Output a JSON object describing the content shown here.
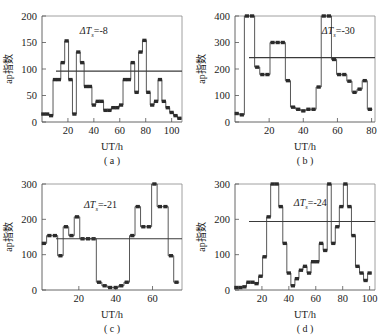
{
  "figure": {
    "panel_count": 4,
    "background": "#ffffff",
    "line_color": "#3a3a3a",
    "marker_color": "#2b2b2b"
  },
  "chart_data": [
    {
      "id": "panel-a",
      "type": "line",
      "caption": "( a )",
      "title": "",
      "xlabel": "UT/h",
      "ylabel": "ap指数",
      "annotation": "ΔT",
      "annotation_sub": "s",
      "annotation_value": "=-8",
      "annotation_full": "ΔTs=-8",
      "xlim": [
        0,
        108
      ],
      "ylim": [
        0,
        200
      ],
      "xticks": [
        20,
        40,
        60,
        80,
        100
      ],
      "yticks": [
        0,
        50,
        100,
        150,
        200
      ],
      "grid": false,
      "mean_value": 96,
      "step": true,
      "x": [
        1,
        4,
        7,
        10,
        13,
        16,
        19,
        22,
        25,
        28,
        31,
        34,
        37,
        40,
        43,
        46,
        49,
        52,
        55,
        58,
        61,
        64,
        67,
        70,
        73,
        76,
        79,
        82,
        85,
        88,
        91,
        94,
        97,
        100,
        103,
        106
      ],
      "y": [
        15,
        15,
        12,
        80,
        80,
        112,
        153,
        80,
        15,
        132,
        112,
        67,
        67,
        32,
        39,
        39,
        22,
        22,
        27,
        27,
        32,
        80,
        80,
        112,
        56,
        132,
        154,
        56,
        32,
        39,
        80,
        39,
        27,
        18,
        12,
        7
      ]
    },
    {
      "id": "panel-b",
      "type": "line",
      "caption": "( b )",
      "title": "",
      "xlabel": "UT/h",
      "ylabel": "ap指数",
      "annotation": "ΔT",
      "annotation_sub": "s",
      "annotation_value": "=-30",
      "annotation_full": "ΔTs=-30",
      "xlim": [
        0,
        82
      ],
      "ylim": [
        0,
        400
      ],
      "xticks": [
        20,
        40,
        60,
        80
      ],
      "yticks": [
        0,
        100,
        200,
        300,
        400
      ],
      "grid": false,
      "mean_value": 243,
      "step": true,
      "x": [
        1,
        4,
        7,
        10,
        13,
        16,
        19,
        22,
        25,
        28,
        31,
        34,
        37,
        40,
        43,
        46,
        49,
        52,
        55,
        58,
        61,
        64,
        67,
        70,
        73,
        76,
        79
      ],
      "y": [
        32,
        27,
        400,
        400,
        207,
        179,
        179,
        300,
        300,
        300,
        156,
        56,
        48,
        42,
        48,
        48,
        132,
        400,
        400,
        236,
        179,
        179,
        154,
        112,
        124,
        156,
        48
      ]
    },
    {
      "id": "panel-c",
      "type": "line",
      "caption": "( c )",
      "title": "",
      "xlabel": "UT/h",
      "ylabel": "ap指数",
      "annotation": "ΔT",
      "annotation_sub": "s",
      "annotation_value": "=-21",
      "annotation_full": "ΔTs=-21",
      "xlim": [
        0,
        76
      ],
      "ylim": [
        0,
        300
      ],
      "xticks": [
        20,
        40,
        60
      ],
      "yticks": [
        0,
        100,
        200,
        300
      ],
      "grid": false,
      "mean_value": 145,
      "step": true,
      "x": [
        1,
        4,
        7,
        10,
        13,
        16,
        19,
        22,
        25,
        28,
        31,
        34,
        37,
        40,
        43,
        46,
        49,
        52,
        55,
        58,
        61,
        64,
        67,
        70,
        73
      ],
      "y": [
        132,
        154,
        154,
        97,
        179,
        154,
        207,
        145,
        145,
        145,
        22,
        12,
        7,
        7,
        12,
        22,
        154,
        236,
        179,
        179,
        300,
        236,
        236,
        97,
        22
      ]
    },
    {
      "id": "panel-d",
      "type": "line",
      "caption": "( d )",
      "title": "",
      "xlabel": "UT/h",
      "ylabel": "ap指数",
      "annotation": "ΔT",
      "annotation_sub": "s",
      "annotation_value": "=-24",
      "annotation_full": "ΔTs=-24",
      "xlim": [
        0,
        104
      ],
      "ylim": [
        0,
        300
      ],
      "xticks": [
        20,
        40,
        60,
        80,
        100
      ],
      "yticks": [
        0,
        100,
        200,
        300
      ],
      "grid": false,
      "mean_value": 194,
      "step": true,
      "x": [
        1,
        4,
        7,
        10,
        13,
        16,
        19,
        22,
        25,
        28,
        31,
        34,
        37,
        40,
        43,
        46,
        49,
        52,
        55,
        58,
        61,
        64,
        67,
        70,
        73,
        76,
        79,
        82,
        85,
        88,
        91,
        94,
        97,
        100
      ],
      "y": [
        7,
        7,
        9,
        22,
        22,
        18,
        39,
        94,
        207,
        300,
        300,
        236,
        132,
        48,
        12,
        32,
        56,
        67,
        48,
        80,
        80,
        132,
        112,
        300,
        132,
        179,
        236,
        300,
        236,
        154,
        67,
        48,
        27,
        48
      ]
    }
  ]
}
